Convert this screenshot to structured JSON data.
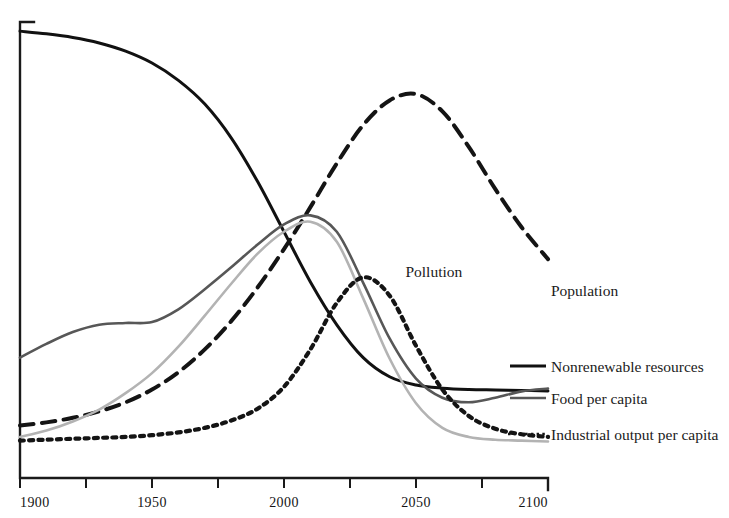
{
  "chart_data": {
    "type": "line",
    "title": "",
    "subtitle": "",
    "xlabel": "",
    "ylabel": "",
    "xlim": [
      1900,
      2100
    ],
    "ylim": [
      0,
      100
    ],
    "grid": false,
    "legend_position": "right",
    "x_ticks": [
      1900,
      1925,
      1950,
      1975,
      2000,
      2025,
      2050,
      2075,
      2100
    ],
    "x_tick_labels": [
      "1900",
      "",
      "1950",
      "",
      "2000",
      "",
      "2050",
      "",
      "2100"
    ],
    "y_ticks": [],
    "y_tick_labels": [],
    "annotations": [
      {
        "text": "Pollution",
        "x": 2046,
        "y": 44
      }
    ],
    "series": [
      {
        "name": "Nonrenewable resources",
        "style": "solid",
        "color": "#111111",
        "width": 3.0,
        "x": [
          1900,
          1910,
          1920,
          1930,
          1940,
          1950,
          1960,
          1970,
          1980,
          1990,
          2000,
          2010,
          2020,
          2030,
          2040,
          2050,
          2060,
          2070,
          2080,
          2090,
          2100
        ],
        "values": [
          98.0,
          97.4,
          96.6,
          95.4,
          93.6,
          91.0,
          87.2,
          82.0,
          74.6,
          65.0,
          54.0,
          43.0,
          33.6,
          26.4,
          22.2,
          20.4,
          19.7,
          19.4,
          19.3,
          19.2,
          19.1
        ]
      },
      {
        "name": "Population",
        "style": "dashed",
        "color": "#141414",
        "width": 4.0,
        "x": [
          1900,
          1910,
          1920,
          1930,
          1940,
          1950,
          1960,
          1970,
          1980,
          1990,
          2000,
          2010,
          2020,
          2030,
          2040,
          2050,
          2060,
          2070,
          2080,
          2090,
          2100
        ],
        "values": [
          11.5,
          12.2,
          13.2,
          14.6,
          16.6,
          19.4,
          23.2,
          28.2,
          34.4,
          41.8,
          50.2,
          59.4,
          69.0,
          77.4,
          82.8,
          84.2,
          80.4,
          72.6,
          63.4,
          55.0,
          48.0
        ]
      },
      {
        "name": "Food per capita",
        "style": "solid",
        "color": "#575757",
        "width": 2.6,
        "x": [
          1900,
          1910,
          1920,
          1930,
          1940,
          1950,
          1960,
          1970,
          1980,
          1990,
          2000,
          2010,
          2020,
          2030,
          2040,
          2050,
          2060,
          2070,
          2080,
          2090,
          2100
        ],
        "values": [
          26.4,
          29.4,
          32.0,
          33.6,
          34.0,
          34.2,
          37.0,
          41.4,
          46.2,
          51.2,
          55.6,
          57.6,
          54.0,
          42.8,
          30.6,
          21.8,
          17.6,
          16.6,
          17.6,
          19.0,
          19.6
        ]
      },
      {
        "name": "Industrial output per capita",
        "style": "solid",
        "color": "#b3b3b3",
        "width": 2.6,
        "x": [
          1900,
          1910,
          1920,
          1930,
          1940,
          1950,
          1960,
          1970,
          1980,
          1990,
          2000,
          2010,
          2020,
          2030,
          2040,
          2050,
          2060,
          2070,
          2080,
          2090,
          2100
        ],
        "values": [
          9.0,
          10.4,
          12.4,
          15.0,
          18.6,
          23.0,
          28.8,
          35.6,
          42.6,
          49.2,
          54.0,
          56.2,
          51.8,
          39.4,
          26.2,
          16.4,
          11.0,
          9.0,
          8.4,
          8.2,
          8.0
        ]
      },
      {
        "name": "Pollution",
        "style": "dotted",
        "color": "#141414",
        "width": 4.2,
        "x": [
          1900,
          1910,
          1920,
          1930,
          1940,
          1950,
          1960,
          1970,
          1980,
          1990,
          2000,
          2010,
          2020,
          2030,
          2040,
          2050,
          2060,
          2070,
          2080,
          2090,
          2100
        ],
        "values": [
          8.2,
          8.4,
          8.6,
          8.8,
          9.0,
          9.4,
          10.0,
          11.0,
          12.6,
          15.2,
          20.0,
          28.2,
          38.4,
          44.0,
          40.0,
          29.0,
          19.4,
          13.6,
          10.8,
          9.6,
          9.0
        ]
      }
    ]
  },
  "legend": {
    "entries": [
      {
        "label": "Population",
        "style": "dashed",
        "color": "#141414"
      },
      {
        "label": "Nonrenewable resources",
        "style": "solid",
        "color": "#111111"
      },
      {
        "label": "Food per capita",
        "style": "solid",
        "color": "#575757"
      },
      {
        "label": "Industrial output per capita",
        "style": "dotted",
        "color": "#141414"
      }
    ]
  },
  "axis": {
    "x_labels": [
      "1900",
      "1950",
      "2000",
      "2050",
      "2100"
    ]
  },
  "colors": {
    "axis": "#1a1a1a",
    "resources": "#111111",
    "population": "#141414",
    "food": "#575757",
    "industrial": "#b3b3b3",
    "pollution": "#141414"
  }
}
